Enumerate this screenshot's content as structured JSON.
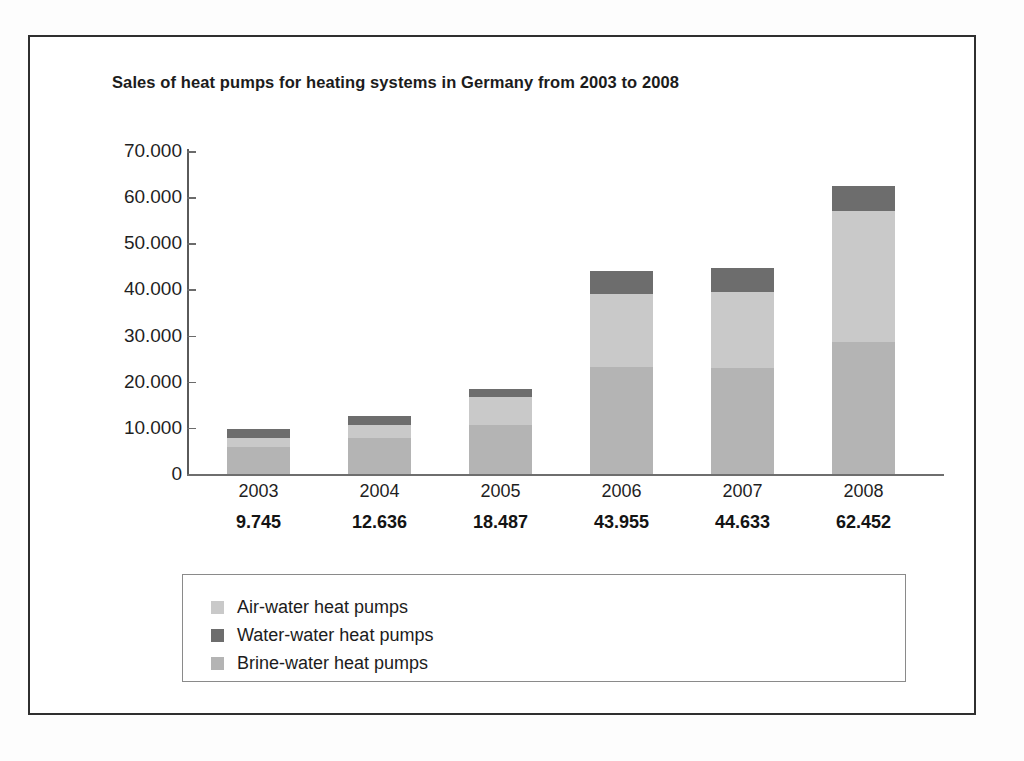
{
  "chart_data": {
    "type": "bar",
    "subtype": "stacked-column",
    "title": "Sales of heat pumps for heating systems in Germany from 2003 to 2008",
    "xlabel": "",
    "ylabel": "",
    "ylim": [
      0,
      70000
    ],
    "ytick_step": 10000,
    "grid": false,
    "legend_position": "bottom",
    "categories": [
      "2003",
      "2004",
      "2005",
      "2006",
      "2007",
      "2008"
    ],
    "ytick_labels": [
      "70.000",
      "60.000",
      "50.000",
      "40.000",
      "30.000",
      "20.000",
      "10.000",
      "0"
    ],
    "ytick_values": [
      70000,
      60000,
      50000,
      40000,
      30000,
      20000,
      10000,
      0
    ],
    "totals": [
      9745,
      12636,
      18487,
      43955,
      44633,
      62452
    ],
    "total_labels": [
      "9.745",
      "12.636",
      "18.487",
      "43.955",
      "44.633",
      "62.452"
    ],
    "stack_order_bottom_to_top": [
      "Brine-water heat pumps",
      "Air-water heat pumps",
      "Water-water heat pumps"
    ],
    "series": [
      {
        "name": "Air-water heat pumps",
        "color": "#c9c9c9",
        "values": [
          1900,
          2800,
          6000,
          16000,
          16600,
          28300
        ]
      },
      {
        "name": "Water-water heat pumps",
        "color": "#6d6d6d",
        "values": [
          2045,
          2036,
          1887,
          4855,
          5133,
          5452
        ]
      },
      {
        "name": "Brine-water heat pumps",
        "color": "#b4b4b4",
        "values": [
          5800,
          7800,
          10600,
          23100,
          22900,
          28700
        ]
      }
    ]
  },
  "legend": {
    "items": [
      {
        "label": "Air-water heat pumps",
        "color": "#c9c9c9"
      },
      {
        "label": "Water-water heat pumps",
        "color": "#6d6d6d"
      },
      {
        "label": "Brine-water heat pumps",
        "color": "#b4b4b4"
      }
    ]
  }
}
